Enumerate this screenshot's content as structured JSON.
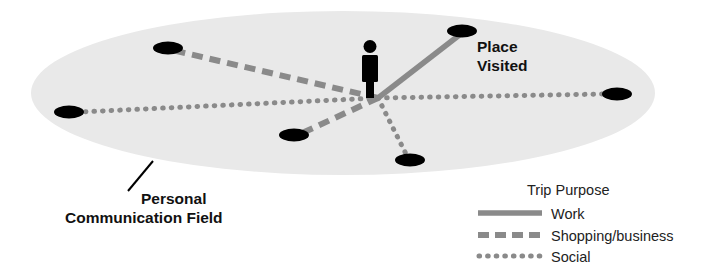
{
  "diagram": {
    "title_labels": {
      "place_visited": [
        "Place",
        "Visited"
      ],
      "personal_communication_field": [
        "Personal",
        "Communication Field"
      ]
    },
    "field": {
      "name": "Personal Communication Field",
      "shape": "ellipse",
      "fill_color": "#e9e9e9",
      "center": {
        "x": 343,
        "y": 93
      },
      "radius_x": 312,
      "radius_y": 82
    },
    "person": {
      "label": "person-figure",
      "color": "#000000",
      "x": 370,
      "y": 68
    },
    "hub": {
      "x": 378,
      "y": 98
    },
    "places": [
      {
        "id": "place-top-left",
        "x": 168,
        "y": 48,
        "trip_purpose": "Shopping/business"
      },
      {
        "id": "place-left",
        "x": 69,
        "y": 112,
        "trip_purpose": "Social"
      },
      {
        "id": "place-bottom-left",
        "x": 294,
        "y": 135,
        "trip_purpose": "Shopping/business"
      },
      {
        "id": "place-bottom",
        "x": 410,
        "y": 160,
        "trip_purpose": "Social"
      },
      {
        "id": "place-top-right",
        "x": 462,
        "y": 31,
        "trip_purpose": "Work"
      },
      {
        "id": "place-right",
        "x": 617,
        "y": 94,
        "trip_purpose": "Social"
      }
    ],
    "marker_style": {
      "shape": "ellipse",
      "fill_color": "#000000",
      "radius_x": 14,
      "radius_y": 6.5
    },
    "leader_line": {
      "from": {
        "x": 128,
        "y": 190
      },
      "to": {
        "x": 152,
        "y": 162
      },
      "color": "#000000"
    }
  },
  "legend": {
    "title": "Trip Purpose",
    "items": [
      {
        "label": "Work",
        "style": "solid",
        "color": "#8a8a8a"
      },
      {
        "label": "Shopping/business",
        "style": "dashed",
        "color": "#8a8a8a"
      },
      {
        "label": "Social",
        "style": "dotted",
        "color": "#8a8a8a"
      }
    ]
  },
  "colors": {
    "line_gray": "#8a8a8a",
    "field_gray": "#e9e9e9",
    "ink": "#111111",
    "background": "#ffffff"
  }
}
